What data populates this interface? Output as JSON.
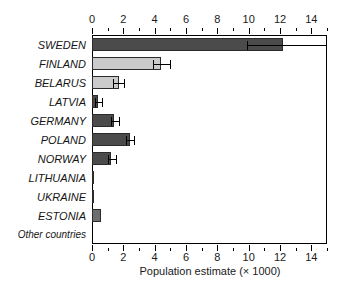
{
  "chart_data": {
    "type": "bar",
    "orientation": "horizontal",
    "title": "",
    "xlabel": "Population estimate (× 1000)",
    "ylabel": "",
    "xlim": [
      0,
      15
    ],
    "xticks": [
      0,
      2,
      4,
      6,
      8,
      10,
      12,
      14
    ],
    "xtick_labels": [
      "0",
      "2",
      "4",
      "6",
      "8",
      "10",
      "12",
      "14"
    ],
    "minor_tick_step": 1,
    "grid": false,
    "legend": "none",
    "axis_positions": [
      "top",
      "bottom"
    ],
    "categories": [
      "SWEDEN",
      "FINLAND",
      "BELARUS",
      "LATVIA",
      "GERMANY",
      "POLAND",
      "NORWAY",
      "LITHUANIA",
      "UKRAINE",
      "ESTONIA",
      "Other countries"
    ],
    "values": [
      12.2,
      4.4,
      1.7,
      0.4,
      1.4,
      2.4,
      1.2,
      0.15,
      0.15,
      0.55,
      0.0
    ],
    "error_low": [
      9.9,
      3.9,
      1.35,
      0.2,
      1.2,
      2.2,
      1.0,
      null,
      null,
      null,
      null
    ],
    "error_high": [
      15.0,
      5.0,
      2.05,
      0.65,
      1.75,
      2.7,
      1.55,
      null,
      null,
      null,
      null
    ],
    "bar_colors": [
      "#4b4b4b",
      "#cbcbcb",
      "#cbcbcb",
      "#4b4b4b",
      "#4b4b4b",
      "#4b4b4b",
      "#4b4b4b",
      "#cbcbcb",
      "#cbcbcb",
      "#6e6e6e",
      "#ffffff"
    ],
    "bar_edge_color": "#2b2b2b",
    "error_bar_color": "#000000",
    "background_color": "#ffffff",
    "axis_color": "#000000"
  },
  "axis": {
    "x_title": "Population estimate (× 1000)"
  }
}
